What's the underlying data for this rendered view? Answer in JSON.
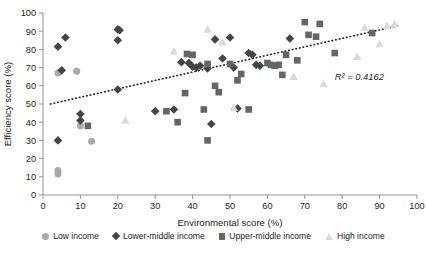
{
  "chart_data": {
    "type": "scatter",
    "title": "",
    "xlabel": "Environmental score (%)",
    "ylabel": "Efficiency score (%)",
    "xlim": [
      0,
      100
    ],
    "ylim": [
      0,
      100
    ],
    "xticks": [
      0,
      10,
      20,
      30,
      40,
      50,
      60,
      70,
      80,
      90,
      100
    ],
    "yticks": [
      0,
      10,
      20,
      30,
      40,
      50,
      60,
      70,
      80,
      90,
      100
    ],
    "grid": false,
    "legend_position": "bottom",
    "annotations": [
      {
        "text": "R² = 0.4162",
        "x": 78,
        "y": 63
      }
    ],
    "trendline": {
      "style": "dotted",
      "color": "#231f20",
      "x0": 2,
      "y0": 50,
      "x1": 95,
      "y1": 93
    },
    "series": [
      {
        "name": "Low income",
        "marker": "circle",
        "color": "#a7a9ac",
        "points": [
          [
            4,
            67
          ],
          [
            9,
            68
          ],
          [
            4,
            13.5
          ],
          [
            4,
            11.5
          ],
          [
            10,
            38
          ],
          [
            13,
            29.5
          ]
        ]
      },
      {
        "name": "Lower-middle income",
        "marker": "diamond",
        "color": "#434649",
        "points": [
          [
            4,
            81.5
          ],
          [
            6,
            86.5
          ],
          [
            5,
            68.5
          ],
          [
            4,
            30
          ],
          [
            10,
            44.5
          ],
          [
            10,
            41
          ],
          [
            20,
            85
          ],
          [
            20,
            58
          ],
          [
            20,
            91
          ],
          [
            20.5,
            90.5
          ],
          [
            30,
            46
          ],
          [
            35,
            47
          ],
          [
            37,
            73
          ],
          [
            39,
            72.5
          ],
          [
            40,
            70.5
          ],
          [
            41,
            70
          ],
          [
            42,
            71
          ],
          [
            44,
            69.5
          ],
          [
            46,
            85.5
          ],
          [
            48,
            75
          ],
          [
            50,
            86.5
          ],
          [
            51,
            70
          ],
          [
            52,
            47.5
          ],
          [
            55,
            78
          ],
          [
            56,
            77
          ],
          [
            57,
            71.5
          ],
          [
            58,
            71
          ],
          [
            66,
            86
          ],
          [
            45,
            39
          ]
        ]
      },
      {
        "name": "Upper-middle income",
        "marker": "square",
        "color": "#636569",
        "points": [
          [
            12,
            38
          ],
          [
            33,
            46
          ],
          [
            36,
            40
          ],
          [
            38,
            56
          ],
          [
            38.5,
            77.5
          ],
          [
            40,
            77
          ],
          [
            43,
            47
          ],
          [
            44,
            72
          ],
          [
            46,
            60
          ],
          [
            47,
            56.5
          ],
          [
            50,
            72
          ],
          [
            52,
            63
          ],
          [
            53,
            66.5
          ],
          [
            55,
            47
          ],
          [
            60,
            72.5
          ],
          [
            61,
            71.5
          ],
          [
            62,
            71
          ],
          [
            63,
            71.5
          ],
          [
            64,
            66
          ],
          [
            65,
            77
          ],
          [
            68,
            74
          ],
          [
            70,
            95
          ],
          [
            71,
            88
          ],
          [
            73,
            87
          ],
          [
            74,
            94
          ],
          [
            78,
            78
          ],
          [
            88,
            89
          ],
          [
            44,
            30
          ]
        ]
      },
      {
        "name": "High income",
        "marker": "triangle",
        "color": "#d8dadc",
        "points": [
          [
            22,
            41
          ],
          [
            35,
            79
          ],
          [
            44,
            91
          ],
          [
            48,
            84
          ],
          [
            51,
            48
          ],
          [
            67,
            65
          ],
          [
            75,
            61
          ],
          [
            84,
            76
          ],
          [
            86,
            92
          ],
          [
            90,
            83
          ],
          [
            92,
            93
          ],
          [
            94,
            94
          ]
        ]
      }
    ]
  },
  "legend": {
    "items": [
      {
        "label": "Low income",
        "marker": "circle",
        "color": "#a7a9ac"
      },
      {
        "label": "Lower-middle income",
        "marker": "diamond",
        "color": "#434649"
      },
      {
        "label": "Upper-middle income",
        "marker": "square",
        "color": "#636569"
      },
      {
        "label": "High income",
        "marker": "triangle",
        "color": "#d8dadc"
      }
    ]
  },
  "axis_style": {
    "line_color": "#939598",
    "text_color": "#231f20"
  }
}
